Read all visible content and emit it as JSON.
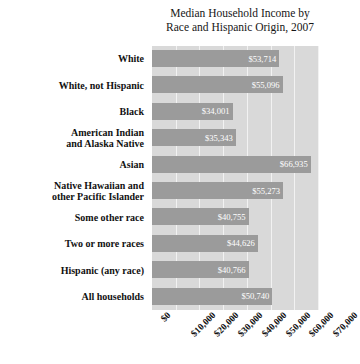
{
  "chart_data": {
    "type": "bar",
    "orientation": "horizontal",
    "title": "Median Household Income by Race and Hispanic Origin, 2007",
    "title_line1": "Median Household Income by",
    "title_line2": "Race and Hispanic Origin, 2007",
    "xlabel": "",
    "ylabel": "",
    "xlim": [
      0,
      70000
    ],
    "grid": true,
    "legend": "none",
    "xticklabels": [
      "$0",
      "$10,000",
      "$20,000",
      "$30,000",
      "$40,000",
      "$50,000",
      "$60,000",
      "$70,000"
    ],
    "xtickvalues": [
      0,
      10000,
      20000,
      30000,
      40000,
      50000,
      60000,
      70000
    ],
    "categories": [
      "White",
      "White, not Hispanic",
      "Black",
      "American Indian and Alaska Native",
      "Asian",
      "Native Hawaiian and other Pacific Islander",
      "Some other race",
      "Two or more races",
      "Hispanic (any race)",
      "All households"
    ],
    "category_lines": [
      [
        "White"
      ],
      [
        "White, not Hispanic"
      ],
      [
        "Black"
      ],
      [
        "American Indian",
        "and Alaska Native"
      ],
      [
        "Asian"
      ],
      [
        "Native Hawaiian and",
        "other Pacific Islander"
      ],
      [
        "Some other race"
      ],
      [
        "Two or more races"
      ],
      [
        "Hispanic (any race)"
      ],
      [
        "All households"
      ]
    ],
    "values": [
      53714,
      55096,
      34001,
      35343,
      66935,
      55273,
      40755,
      44626,
      40766,
      50740
    ],
    "value_labels": [
      "$53,714",
      "$55,096",
      "$34,001",
      "$35,343",
      "$66,935",
      "$55,273",
      "$40,755",
      "$44,626",
      "$40,766",
      "$50,740"
    ],
    "colors": {
      "bar": "#9b9b9b",
      "plot_background": "#d9d9d9",
      "gridline": "#f2f2f2",
      "value_label": "#ffffff",
      "text": "#111111",
      "page_background": "#ffffff"
    }
  }
}
